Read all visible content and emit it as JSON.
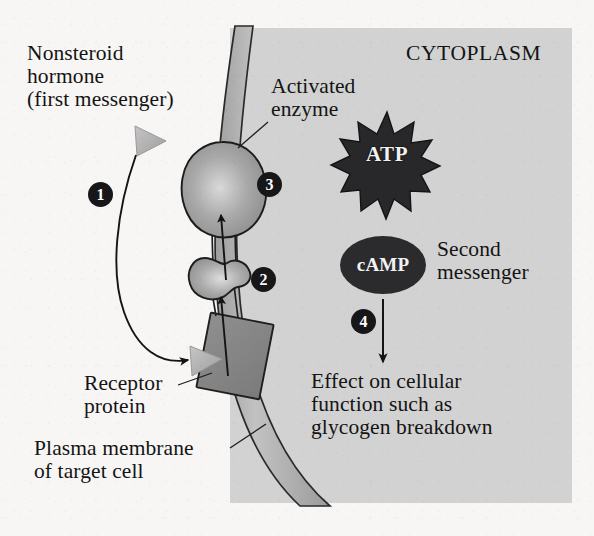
{
  "figure": {
    "background_color": "#f7f6f4",
    "cytoplasm_fill": "#d2d2d2",
    "membrane_fill": "#b4b4b4",
    "receptor_fill": "#8b8b8b",
    "protein_fill": "#9a9a9a",
    "ink_color": "#141414"
  },
  "labels": {
    "nonsteroid_hormone": "Nonsteroid\nhormone\n(first messenger)",
    "activated_enzyme": "Activated\nenzyme",
    "cytoplasm": "CYTOPLASM",
    "second_messenger": "Second\nmessenger",
    "effect": "Effect on cellular\nfunction such as\nglycogen breakdown",
    "receptor_protein": "Receptor\nprotein",
    "plasma_membrane": "Plasma membrane\nof target cell"
  },
  "molecules": {
    "atp": "ATP",
    "camp": "cAMP"
  },
  "steps": [
    {
      "number": "1",
      "meaning": "hormone-binds-receptor"
    },
    {
      "number": "2",
      "meaning": "g-protein-activated"
    },
    {
      "number": "3",
      "meaning": "enzyme-activated"
    },
    {
      "number": "4",
      "meaning": "second-messenger-effect"
    }
  ],
  "icons": {
    "hormone_triangle": "triangle-icon",
    "atp_burst": "starburst-icon",
    "camp_oval": "ellipse-icon",
    "curved_arrow": "curved-arrow-icon",
    "down_arrow": "down-arrow-icon",
    "up_arrow": "up-arrow-icon",
    "leader_line": "leader-line-icon"
  }
}
